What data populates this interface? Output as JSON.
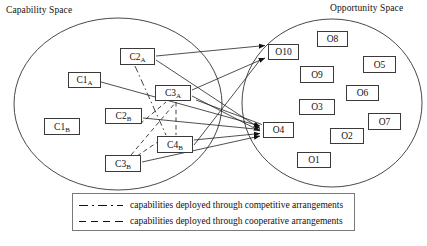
{
  "diagram": {
    "capability_space_title": "Capability Space",
    "opportunity_space_title": "Opportunity Space",
    "capability_nodes": [
      {
        "id": "C1A",
        "base": "C1",
        "sub": "A",
        "x": 68,
        "y": 72,
        "w": 33,
        "h": 16
      },
      {
        "id": "C1B",
        "base": "C1",
        "sub": "B",
        "x": 44,
        "y": 118,
        "w": 36,
        "h": 17
      },
      {
        "id": "C2A",
        "base": "C2",
        "sub": "A",
        "x": 120,
        "y": 48,
        "w": 35,
        "h": 17
      },
      {
        "id": "C2B",
        "base": "C2",
        "sub": "B",
        "x": 105,
        "y": 108,
        "w": 37,
        "h": 16
      },
      {
        "id": "C3A",
        "base": "C3",
        "sub": "A",
        "x": 155,
        "y": 85,
        "w": 36,
        "h": 16
      },
      {
        "id": "C3B",
        "base": "C3",
        "sub": "B",
        "x": 105,
        "y": 155,
        "w": 36,
        "h": 17
      },
      {
        "id": "C4B",
        "base": "C4",
        "sub": "B",
        "x": 157,
        "y": 136,
        "w": 36,
        "h": 17
      }
    ],
    "opportunity_nodes": [
      {
        "id": "O10",
        "label": "O10",
        "x": 268,
        "y": 44,
        "w": 31,
        "h": 16
      },
      {
        "id": "O8",
        "label": "O8",
        "x": 317,
        "y": 31,
        "w": 31,
        "h": 16
      },
      {
        "id": "O5",
        "label": "O5",
        "x": 363,
        "y": 56,
        "w": 33,
        "h": 17
      },
      {
        "id": "O9",
        "label": "O9",
        "x": 300,
        "y": 66,
        "w": 34,
        "h": 17
      },
      {
        "id": "O6",
        "label": "O6",
        "x": 346,
        "y": 85,
        "w": 33,
        "h": 16
      },
      {
        "id": "O3",
        "label": "O3",
        "x": 299,
        "y": 99,
        "w": 36,
        "h": 16
      },
      {
        "id": "O7",
        "label": "O7",
        "x": 368,
        "y": 113,
        "w": 33,
        "h": 17
      },
      {
        "id": "O4",
        "label": "O4",
        "x": 263,
        "y": 122,
        "w": 31,
        "h": 16
      },
      {
        "id": "O2",
        "label": "O2",
        "x": 330,
        "y": 128,
        "w": 34,
        "h": 16
      },
      {
        "id": "O1",
        "label": "O1",
        "x": 297,
        "y": 152,
        "w": 34,
        "h": 16
      }
    ],
    "legend": [
      {
        "style": "dash-dot",
        "label": "capabilities deployed through competitive arrangements"
      },
      {
        "style": "dashed",
        "label": "capabilities deployed through cooperative arrangements"
      }
    ],
    "colors": {
      "line": "#222222",
      "node_border": "#3a3a3a",
      "ellipse": "#333333",
      "legend_border": "#7a7a7a",
      "background": "#ffffff"
    }
  }
}
